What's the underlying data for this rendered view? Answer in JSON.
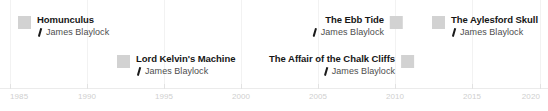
{
  "chart_data": {
    "type": "timeline",
    "title": "",
    "xlabel": "",
    "ylabel": "",
    "xlim": [
      1985,
      2020
    ],
    "grid": true,
    "legend": "none",
    "axis": {
      "ticks": [
        {
          "label": "1985",
          "value": 1985,
          "x": 10
        },
        {
          "label": "1990",
          "value": 1990,
          "x": 87
        },
        {
          "label": "1995",
          "value": 1995,
          "x": 164
        },
        {
          "label": "2000",
          "value": 2000,
          "x": 241
        },
        {
          "label": "2005",
          "value": 2005,
          "x": 318
        },
        {
          "label": "2010",
          "value": 2010,
          "x": 395
        },
        {
          "label": "2015",
          "value": 2015,
          "x": 472
        },
        {
          "label": "2020",
          "value": 2020,
          "x": 540
        }
      ]
    },
    "gridlines_x": [
      10,
      87,
      164,
      241,
      318,
      395,
      472,
      540
    ],
    "events": [
      {
        "title": "Homunculus",
        "author": "James Blaylock",
        "marker_side": "left",
        "x": 18,
        "y": 14,
        "row": 1,
        "color": "#d2d2d2"
      },
      {
        "title": "Lord Kelvin's Machine",
        "author": "James Blaylock",
        "marker_side": "left",
        "x": 117,
        "y": 53,
        "row": 2,
        "color": "#d2d2d2"
      },
      {
        "title": "The Ebb Tide",
        "author": "James Blaylock",
        "marker_side": "right",
        "x": 403,
        "y": 14,
        "row": 1,
        "color": "#d2d2d2"
      },
      {
        "title": "The Affair of the Chalk Cliffs",
        "author": "James Blaylock",
        "marker_side": "right",
        "x": 414,
        "y": 53,
        "row": 2,
        "color": "#d2d2d2"
      },
      {
        "title": "The Aylesford Skull",
        "author": "James Blaylock",
        "marker_side": "left",
        "x": 432,
        "y": 14,
        "row": 1,
        "color": "#d2d2d2"
      }
    ],
    "colors": {
      "marker": "#d2d2d2",
      "gridline": "#f2f2f2",
      "axis_label": "#cfcfcf",
      "title_text": "#161616",
      "author_text": "#4d4d4d",
      "background": "#ffffff"
    }
  }
}
